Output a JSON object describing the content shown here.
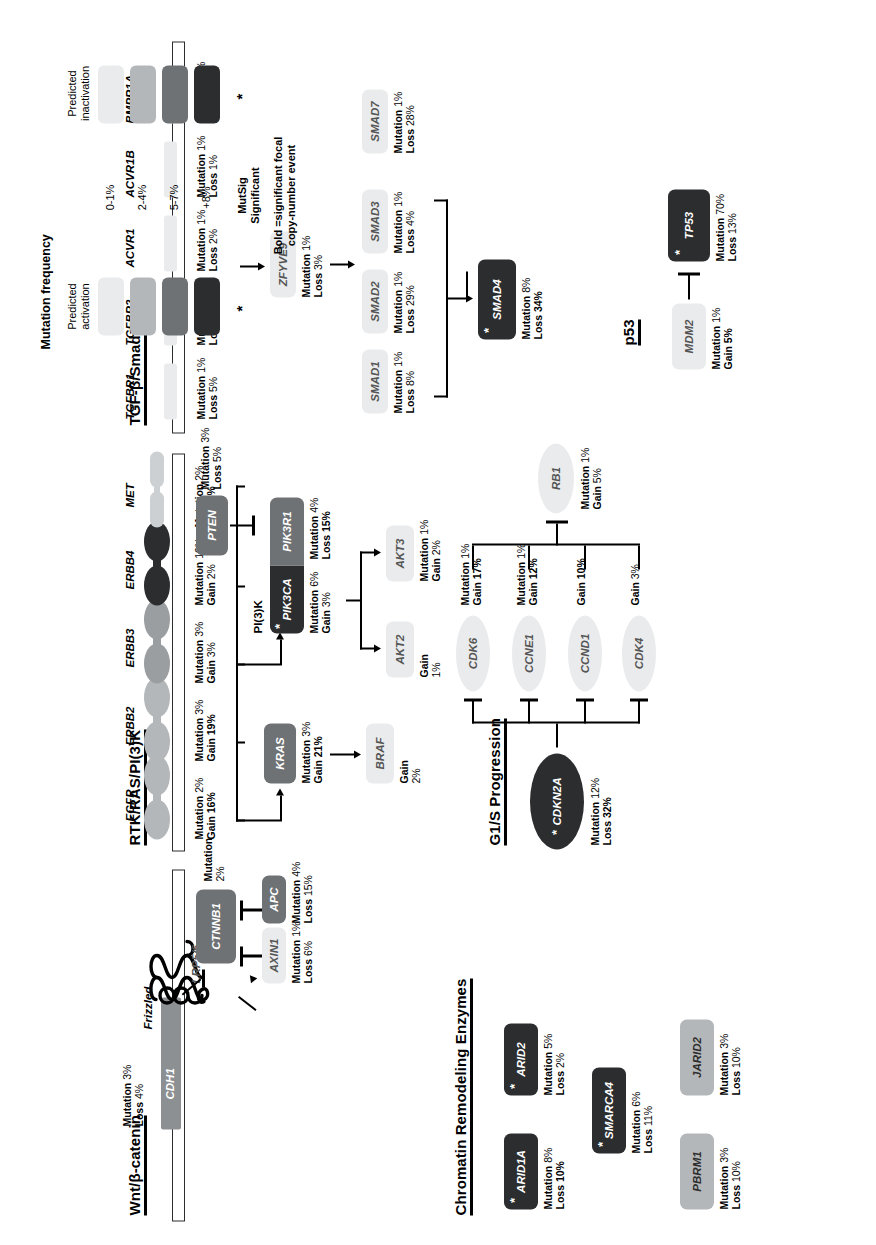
{
  "figure": {
    "orientation_note": "rotated",
    "sections": {
      "wnt": "Wnt/β-catenin",
      "rtk": "RTK/RAS/PI(3)K",
      "tgf": "TGF-β/Smad4",
      "chromatin": "Chromatin Remodeling Enzymes",
      "g1s": "G1/S Progression",
      "p53": "p53"
    }
  },
  "labels": {
    "mutation": "Mutation",
    "loss": "Loss",
    "gain": "Gain",
    "pi3k": "PI(3)K",
    "frizzled": "Frizzled",
    "lrp": "LRP5/6"
  },
  "wnt": {
    "cdh1": {
      "name": "CDH1",
      "mutation": "3%",
      "loss": "4%",
      "level": 2
    },
    "ctnnb1": {
      "name": "CTNNB1",
      "mutation": "2%",
      "level": 2
    },
    "axin1": {
      "name": "AXIN1",
      "mutation": "1%",
      "loss": "6%",
      "level": 0
    },
    "apc": {
      "name": "APC",
      "mutation": "4%",
      "loss": "15%",
      "level": 2
    }
  },
  "rtk": {
    "receptors": [
      {
        "name": "EGFR",
        "mutation": "2%",
        "gain": "16%",
        "gain_bold": true,
        "level": 1
      },
      {
        "name": "ERBB2",
        "mutation": "3%",
        "gain": "19%",
        "gain_bold": true,
        "level": 1
      },
      {
        "name": "ERBB3",
        "mutation": "3%",
        "gain": "3%",
        "gain_bold": false,
        "level": 1
      },
      {
        "name": "ERBB4",
        "mutation": "10%",
        "gain": "2%",
        "gain_bold": false,
        "level": 3
      },
      {
        "name": "MET",
        "mutation": "2%",
        "gain": "6%",
        "gain_bold": true,
        "level": 1
      }
    ],
    "kras": {
      "name": "KRAS",
      "mutation": "3%",
      "gain": "21%",
      "gain_bold": true,
      "level": 2
    },
    "braf": {
      "name": "BRAF",
      "gain": "2%",
      "level": 0
    },
    "pik3ca": {
      "name": "PIK3CA",
      "mutation": "6%",
      "gain": "3%",
      "level": 3,
      "mutsig": true
    },
    "pik3r1": {
      "name": "PIK3R1",
      "mutation": "4%",
      "loss": "15%",
      "level": 2
    },
    "pten": {
      "name": "PTEN",
      "mutation": "3%",
      "loss": "5%",
      "level": 2
    },
    "akt2": {
      "name": "AKT2",
      "gain": "1%",
      "level": 0
    },
    "akt3": {
      "name": "AKT3",
      "mutation": "1%",
      "gain": "2%",
      "level": 0
    }
  },
  "tgf": {
    "receptors": [
      {
        "name": "TGFBR1",
        "mutation": "1%",
        "loss": "5%",
        "level": 0
      },
      {
        "name": "TGFBR2",
        "mutation": "1%",
        "loss": "7%",
        "level": 0
      },
      {
        "name": "ACVR1",
        "mutation": "1%",
        "loss": "2%",
        "level": 0
      },
      {
        "name": "ACVR1B",
        "mutation": "1%",
        "loss": "1%",
        "level": 0
      },
      {
        "name": "BMPR1A",
        "mutation": "1%",
        "loss": "5%",
        "level": 0
      }
    ],
    "zfyve9": {
      "name": "ZFYVE9",
      "mutation": "1%",
      "loss": "3%",
      "level": 0
    },
    "smads": [
      {
        "name": "SMAD1",
        "mutation": "1%",
        "loss": "8%",
        "level": 0
      },
      {
        "name": "SMAD2",
        "mutation": "1%",
        "loss": "29%",
        "level": 0
      },
      {
        "name": "SMAD3",
        "mutation": "1%",
        "loss": "4%",
        "level": 0
      },
      {
        "name": "SMAD7",
        "mutation": "1%",
        "loss": "28%",
        "level": 0
      }
    ],
    "smad4": {
      "name": "SMAD4",
      "mutation": "8%",
      "loss": "34%",
      "loss_bold": true,
      "level": 3,
      "mutsig": true
    }
  },
  "chromatin": [
    {
      "name": "ARID1A",
      "mutation": "8%",
      "loss": "10%",
      "loss_bold": true,
      "level": 3,
      "mutsig": true
    },
    {
      "name": "ARID2",
      "mutation": "5%",
      "loss": "2%",
      "loss_bold": false,
      "level": 3,
      "mutsig": true
    },
    {
      "name": "SMARCA4",
      "mutation": "6%",
      "loss": "11%",
      "loss_bold": false,
      "level": 3,
      "mutsig": true
    },
    {
      "name": "PBRM1",
      "mutation": "3%",
      "loss": "10%",
      "loss_bold": false,
      "level": 1
    },
    {
      "name": "JARID2",
      "mutation": "3%",
      "loss": "10%",
      "loss_bold": false,
      "level": 1
    }
  ],
  "g1s": {
    "cdkn2a": {
      "name": "CDKN2A",
      "mutation": "12%",
      "loss": "32%",
      "loss_bold": true,
      "level": 3,
      "mutsig": true
    },
    "targets": [
      {
        "name": "CDK4",
        "gain": "3%",
        "gain_bold": false,
        "level": 0
      },
      {
        "name": "CCND1",
        "gain": "10%",
        "gain_bold": true,
        "level": 0
      },
      {
        "name": "CCNE1",
        "mutation": "1%",
        "gain": "12%",
        "gain_bold": true,
        "level": 0
      },
      {
        "name": "CDK6",
        "mutation": "1%",
        "gain": "17%",
        "gain_bold": true,
        "level": 0
      }
    ],
    "rb1": {
      "name": "RB1",
      "mutation": "1%",
      "gain": "5%",
      "level": 0
    }
  },
  "p53": {
    "tp53": {
      "name": "TP53",
      "mutation": "70%",
      "loss": "13%",
      "level": 3,
      "mutsig": true
    },
    "mdm2": {
      "name": "MDM2",
      "mutation": "1%",
      "gain": "5%",
      "level": 0
    }
  },
  "legend": {
    "title": "Mutation frequency",
    "col_left": "Predicted\nactivation",
    "col_left_l1": "Predicted",
    "col_left_l2": "activation",
    "col_right_l1": "Predicted",
    "col_right_l2": "inactivation",
    "rows": [
      "0-1%",
      "2-4%",
      "5-7%",
      "+8%"
    ],
    "star": "*",
    "mutsig_l1": "MutSig",
    "mutsig_l2": "Significant",
    "bold_l1": "Bold =significant focal",
    "bold_l2": "copy-number event",
    "colors": [
      "#e9ebec",
      "#b4b7b9",
      "#6e7275",
      "#2b2d2f"
    ]
  }
}
